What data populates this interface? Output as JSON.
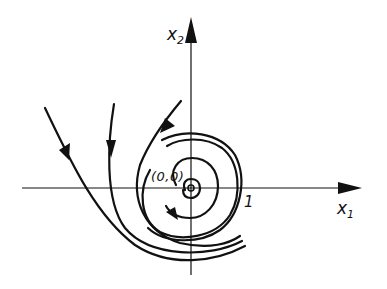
{
  "diagram": {
    "type": "phase-portrait",
    "colors": {
      "ink": "#111111",
      "background": "#ffffff"
    },
    "axes": {
      "x": {
        "label": "x",
        "subscript": "1"
      },
      "y": {
        "label": "x",
        "subscript": "2"
      }
    },
    "origin_label": "(0,0)",
    "tick_label": "1",
    "trajectories": [
      {
        "name": "outer-left",
        "arrow": "down"
      },
      {
        "name": "middle-left",
        "arrow": "down"
      },
      {
        "name": "inner-left",
        "arrow": "down-left"
      },
      {
        "name": "spiral",
        "arrow": "down-right"
      }
    ]
  }
}
